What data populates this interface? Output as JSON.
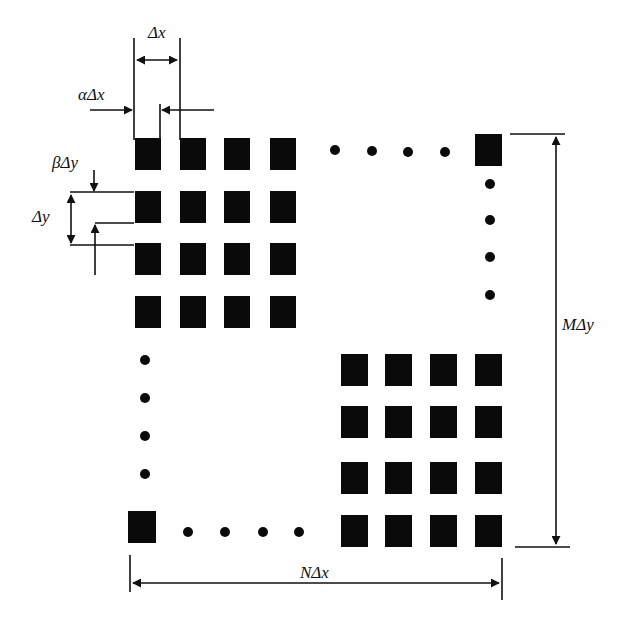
{
  "diagram": {
    "colors": {
      "element": "#0a0a0a",
      "line": "#111111",
      "background": "#ffffff"
    },
    "labels": {
      "dx": "Δx",
      "alpha_dx": "αΔx",
      "beta_dy": "βΔy",
      "dy": "Δy",
      "m_dy": "MΔy",
      "n_dx": "NΔx"
    },
    "top_left_grid": {
      "cols_x": [
        135,
        180,
        224,
        270
      ],
      "rows_y": [
        138,
        191,
        243,
        296
      ],
      "w": 26,
      "h": 32
    },
    "bottom_right_grid": {
      "cols_x": [
        341,
        385,
        430,
        475
      ],
      "rows_y": [
        354,
        406,
        462,
        515
      ],
      "w": 27,
      "h": 32
    },
    "corner_elements": [
      {
        "name": "top-right-element",
        "x": 475,
        "y": 134,
        "w": 27,
        "h": 32
      },
      {
        "name": "bottom-left-element",
        "x": 128,
        "y": 511,
        "w": 28,
        "h": 32
      }
    ],
    "ellipsis_dots": {
      "top": [
        [
          335,
          150
        ],
        [
          372,
          151
        ],
        [
          408,
          152
        ],
        [
          445,
          152
        ]
      ],
      "right": [
        [
          490,
          184
        ],
        [
          490,
          220
        ],
        [
          490,
          257
        ],
        [
          490,
          295
        ]
      ],
      "left": [
        [
          145,
          360
        ],
        [
          145,
          398
        ],
        [
          145,
          436
        ],
        [
          145,
          474
        ]
      ],
      "bottom": [
        [
          188,
          532
        ],
        [
          225,
          532
        ],
        [
          263,
          532
        ],
        [
          299,
          532
        ]
      ]
    }
  }
}
